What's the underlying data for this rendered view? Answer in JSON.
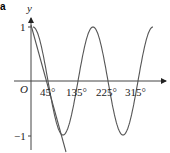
{
  "corner_label": "a",
  "chart_data": {
    "type": "line",
    "title": "",
    "xlabel": "",
    "ylabel": "y",
    "origin_label": "O",
    "x_ticks": [
      "45°",
      "135°",
      "225°",
      "315°"
    ],
    "x_tick_values": [
      45,
      135,
      225,
      315
    ],
    "y_ticks": [
      "1",
      "−1"
    ],
    "y_tick_values": [
      1,
      -1
    ],
    "xlim": [
      0,
      360
    ],
    "ylim": [
      -1.1,
      1.1
    ],
    "grid": false,
    "series": [
      {
        "name": "y = cos 2x",
        "x": [
          0,
          45,
          90,
          135,
          180,
          225,
          270,
          315,
          360
        ],
        "values": [
          1,
          0,
          -1,
          0,
          1,
          0,
          -1,
          0,
          1
        ]
      },
      {
        "name": "line",
        "x": [
          0,
          110
        ],
        "values": [
          1,
          -1.4
        ]
      }
    ]
  }
}
